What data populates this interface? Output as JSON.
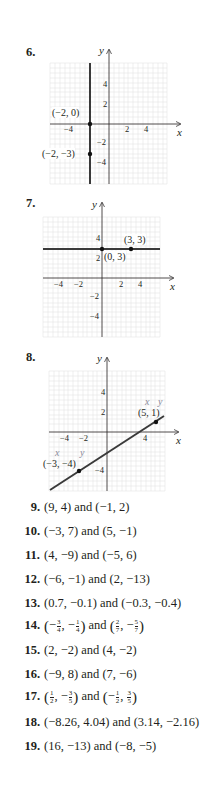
{
  "problems": {
    "graph_problems": [
      {
        "number": "6.",
        "axis_labels": {
          "x": "x",
          "y": "y"
        },
        "x_ticks": [
          "−4",
          "2",
          "4"
        ],
        "y_ticks": [
          "4",
          "2",
          "−2",
          "−4"
        ],
        "line": "vertical line x = −2",
        "points": [
          {
            "label": "(−2, 0)",
            "x": -2,
            "y": 0
          },
          {
            "label": "(−2, −3)",
            "x": -2,
            "y": -3
          }
        ]
      },
      {
        "number": "7.",
        "axis_labels": {
          "x": "x",
          "y": "y"
        },
        "x_ticks": [
          "−4",
          "−2",
          "2",
          "4"
        ],
        "y_ticks": [
          "4",
          "2",
          "−2",
          "−4"
        ],
        "line": "horizontal line y = 3",
        "points": [
          {
            "label": "(0, 3)",
            "x": 0,
            "y": 3
          },
          {
            "label": "(3, 3)",
            "x": 3,
            "y": 3
          }
        ]
      },
      {
        "number": "8.",
        "axis_labels": {
          "x": "x",
          "y": "y"
        },
        "x_ticks": [
          "−4",
          "−2",
          "4"
        ],
        "y_ticks": [
          "4",
          "2",
          "−4"
        ],
        "line": "line through (−3, −4) and (5, 1)",
        "points": [
          {
            "label": "(−3, −4)",
            "x": -3,
            "y": -4,
            "annotation_x": "x",
            "annotation_y": "y"
          },
          {
            "label": "(5, 1)",
            "x": 5,
            "y": 1,
            "annotation_x": "x",
            "annotation_y": "y"
          }
        ]
      }
    ],
    "exercises": [
      {
        "number": "9.",
        "text": "(9, 4) and (−1, 2)"
      },
      {
        "number": "10.",
        "text": "(−3, 7) and (5, −1)"
      },
      {
        "number": "11.",
        "text": "(4, −9) and (−5, 6)"
      },
      {
        "number": "12.",
        "text": "(−6, −1) and (2, −13)"
      },
      {
        "number": "13.",
        "text": "(0.7, −0.1) and (−0.3, −0.4)"
      },
      {
        "number": "14.",
        "p1_x_sign": "−",
        "p1_x_num": "3",
        "p1_x_den": "4",
        "p1_y_sign": "−",
        "p1_y_num": "1",
        "p1_y_den": "4",
        "connector": "and",
        "p2_x_sign": "",
        "p2_x_num": "2",
        "p2_x_den": "7",
        "p2_y_sign": "−",
        "p2_y_num": "5",
        "p2_y_den": "7"
      },
      {
        "number": "15.",
        "text": "(2, −2) and (4, −2)"
      },
      {
        "number": "16.",
        "text": "(−9, 8) and (7, −6)"
      },
      {
        "number": "17.",
        "p1_x_sign": "",
        "p1_x_num": "1",
        "p1_x_den": "2",
        "p1_y_sign": "−",
        "p1_y_num": "3",
        "p1_y_den": "5",
        "connector": "and",
        "p2_x_sign": "−",
        "p2_x_num": "1",
        "p2_x_den": "2",
        "p2_y_sign": "",
        "p2_y_num": "3",
        "p2_y_den": "5"
      },
      {
        "number": "18.",
        "text": "(−8.26, 4.04) and (3.14, −2.16)"
      },
      {
        "number": "19.",
        "text": "(16, −13) and (−8, −5)"
      }
    ]
  },
  "colors": {
    "ink": "#231f20",
    "grid": "#e2e2e2",
    "annotation": "#8a8a9a"
  }
}
